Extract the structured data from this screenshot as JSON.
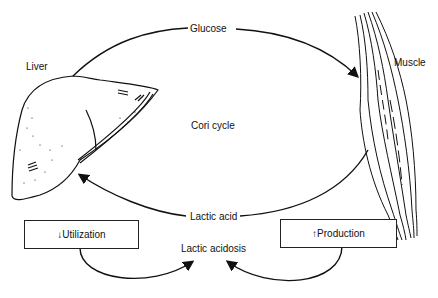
{
  "diagram": {
    "title": "Cori cycle",
    "organs": {
      "liver": "Liver",
      "muscle": "Muscle"
    },
    "edges": {
      "glucose": "Glucose",
      "lactic_acid": "Lactic acid"
    },
    "condition": "Lactic acidosis",
    "boxes": {
      "utilization": "↓Utilization",
      "production": "↑Production"
    }
  }
}
